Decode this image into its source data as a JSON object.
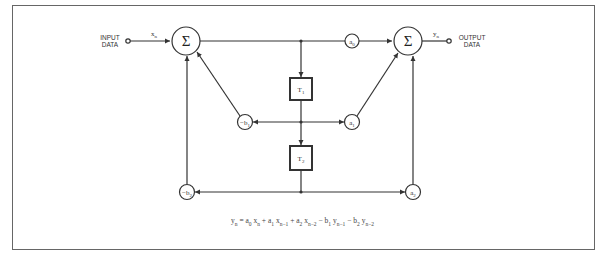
{
  "input": {
    "label_line1": "INPUT",
    "label_line2": "DATA",
    "signal": "x",
    "signal_sub": "n"
  },
  "output": {
    "label_line1": "OUTPUT",
    "label_line2": "DATA",
    "signal": "y",
    "signal_sub": "n"
  },
  "summers": [
    {
      "symbol": "Σ"
    },
    {
      "symbol": "Σ"
    }
  ],
  "delays": [
    {
      "label": "T",
      "sub": "1"
    },
    {
      "label": "T",
      "sub": "2"
    }
  ],
  "coefficients": {
    "a0": {
      "base": "a",
      "sub": "0"
    },
    "a1": {
      "base": "a",
      "sub": "1"
    },
    "a2": {
      "base": "a",
      "sub": "2"
    },
    "b1": {
      "base": "−b",
      "sub": "1"
    },
    "b2": {
      "base": "−b",
      "sub": "2"
    }
  },
  "equation": {
    "terms": [
      "y",
      "n",
      " = a",
      "0",
      " x",
      "n",
      " + a",
      "1",
      " x",
      "n−1",
      " + a",
      "2",
      " x",
      "n−2",
      " − b",
      "1",
      " y",
      "n−1",
      " − b",
      "2",
      " y",
      "n−2"
    ]
  },
  "colors": {
    "line": "#333333",
    "frame": "#666666"
  }
}
